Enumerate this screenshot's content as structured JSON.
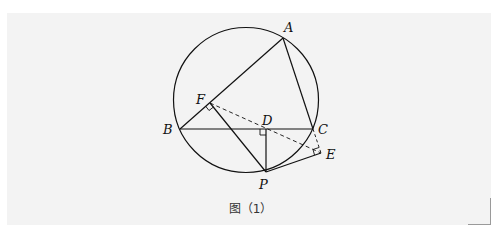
{
  "figure": {
    "caption": "图（1）",
    "colors": {
      "background": "#f3f3f3",
      "stroke": "#111111"
    },
    "circle": {
      "cx": 246,
      "cy": 100,
      "r": 72.5
    },
    "points": {
      "A": {
        "label": "A",
        "x": 283,
        "y": 38
      },
      "B": {
        "label": "B",
        "x": 180,
        "y": 129
      },
      "C": {
        "label": "C",
        "x": 313,
        "y": 129
      },
      "D": {
        "label": "D",
        "x": 265,
        "y": 129
      },
      "E": {
        "label": "E",
        "x": 321,
        "y": 153
      },
      "F": {
        "label": "F",
        "x": 210,
        "y": 103
      },
      "P": {
        "label": "P",
        "x": 266,
        "y": 172
      }
    },
    "solid_segments": [
      "AB",
      "AC",
      "BC",
      "FP",
      "DP",
      "PE"
    ],
    "dashed_segments": [
      "FE",
      "CE"
    ],
    "right_angles": [
      "F",
      "D",
      "E"
    ]
  }
}
